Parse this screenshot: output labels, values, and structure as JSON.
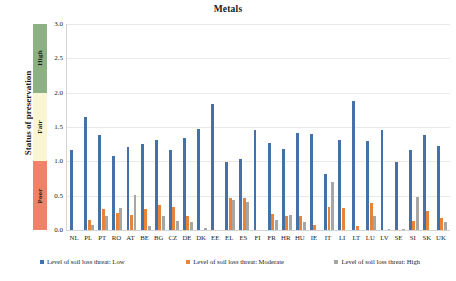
{
  "chart_data": {
    "type": "bar",
    "title": "Metals",
    "xlabel": "",
    "ylabel": "Status of preservation",
    "ylim": [
      0,
      3
    ],
    "yticks": [
      "0.0",
      "0.5",
      "1.0",
      "1.5",
      "2.0",
      "2.5",
      "3.0"
    ],
    "grid": true,
    "legend_position": "bottom",
    "categories": [
      "NL",
      "PL",
      "PT",
      "RO",
      "AT",
      "BE",
      "BG",
      "CZ",
      "DE",
      "DK",
      "EE",
      "EL",
      "ES",
      "FI",
      "FR",
      "HR",
      "HU",
      "IE",
      "IT",
      "LI",
      "LT",
      "LU",
      "LV",
      "SE",
      "SI",
      "SK",
      "UK"
    ],
    "series": [
      {
        "name": "Level of soil loss threat: Low",
        "color": "#4472a8",
        "values": [
          1.16,
          1.65,
          1.39,
          1.08,
          1.21,
          1.25,
          1.31,
          1.16,
          1.34,
          1.47,
          1.84,
          0.99,
          1.04,
          1.45,
          1.26,
          1.18,
          1.41,
          1.4,
          0.82,
          1.31,
          1.88,
          1.29,
          1.46,
          0.99,
          1.17,
          1.39,
          1.23
        ]
      },
      {
        "name": "Level of soil loss threat: Moderate",
        "color": "#e8833a",
        "values": [
          0.0,
          0.14,
          0.31,
          0.25,
          0.22,
          0.31,
          0.37,
          0.34,
          0.21,
          0.0,
          0.0,
          0.47,
          0.46,
          0.0,
          0.24,
          0.21,
          0.2,
          0.08,
          0.33,
          0.32,
          0.06,
          0.39,
          0.0,
          0.0,
          0.13,
          0.27,
          0.18
        ]
      },
      {
        "name": "Level of soil loss threat: High",
        "color": "#a6a6a6",
        "values": [
          0.0,
          0.07,
          0.2,
          0.32,
          0.51,
          0.06,
          0.2,
          0.13,
          0.11,
          0.03,
          0.0,
          0.44,
          0.41,
          0.0,
          0.15,
          0.22,
          0.12,
          0.0,
          0.7,
          0.0,
          0.0,
          0.21,
          0.02,
          0.01,
          0.48,
          0.0,
          0.12
        ]
      }
    ],
    "status_band": {
      "label": "Status of preservation",
      "segments": [
        {
          "label": "High",
          "from": 2.0,
          "to": 3.0,
          "color": "#8db183"
        },
        {
          "label": "Fair",
          "from": 1.0,
          "to": 2.0,
          "color": "#faf5d2"
        },
        {
          "label": "Poor",
          "from": 0.0,
          "to": 1.0,
          "color": "#ef8268"
        }
      ]
    }
  }
}
